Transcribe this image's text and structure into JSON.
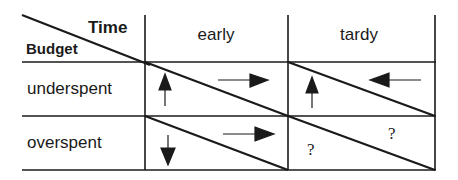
{
  "diagram": {
    "corner": {
      "top_right_label": "Time",
      "bottom_left_label": "Budget"
    },
    "columns": [
      {
        "label": "early"
      },
      {
        "label": "tardy"
      }
    ],
    "rows": [
      {
        "label": "underspent"
      },
      {
        "label": "overspent"
      }
    ],
    "cells": [
      {
        "row": "underspent",
        "col": "early",
        "lower_left": "up-arrow",
        "upper_right": "right-arrow"
      },
      {
        "row": "underspent",
        "col": "tardy",
        "lower_left": "up-arrow",
        "upper_right": "left-arrow"
      },
      {
        "row": "overspent",
        "col": "early",
        "lower_left": "down-arrow",
        "upper_right": "right-arrow"
      },
      {
        "row": "overspent",
        "col": "tardy",
        "lower_left": "?",
        "upper_right": "?"
      }
    ],
    "line_color": "#1a1a1a"
  }
}
